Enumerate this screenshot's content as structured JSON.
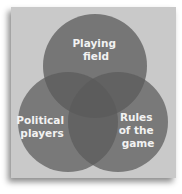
{
  "diagram": {
    "type": "venn",
    "colors": {
      "panel": "#c9c9c9",
      "circle": "#6e6e6e"
    },
    "circles": [
      {
        "id": "playing-field",
        "lines": [
          "Playing",
          "field"
        ],
        "cx": 95,
        "cy": 66,
        "r": 52
      },
      {
        "id": "political-players",
        "lines": [
          "Political",
          "players"
        ],
        "cx": 68,
        "cy": 122,
        "r": 50
      },
      {
        "id": "rules-of-the-game",
        "lines": [
          "Rules",
          "of the",
          "game"
        ],
        "cx": 118,
        "cy": 122,
        "r": 50
      }
    ]
  }
}
